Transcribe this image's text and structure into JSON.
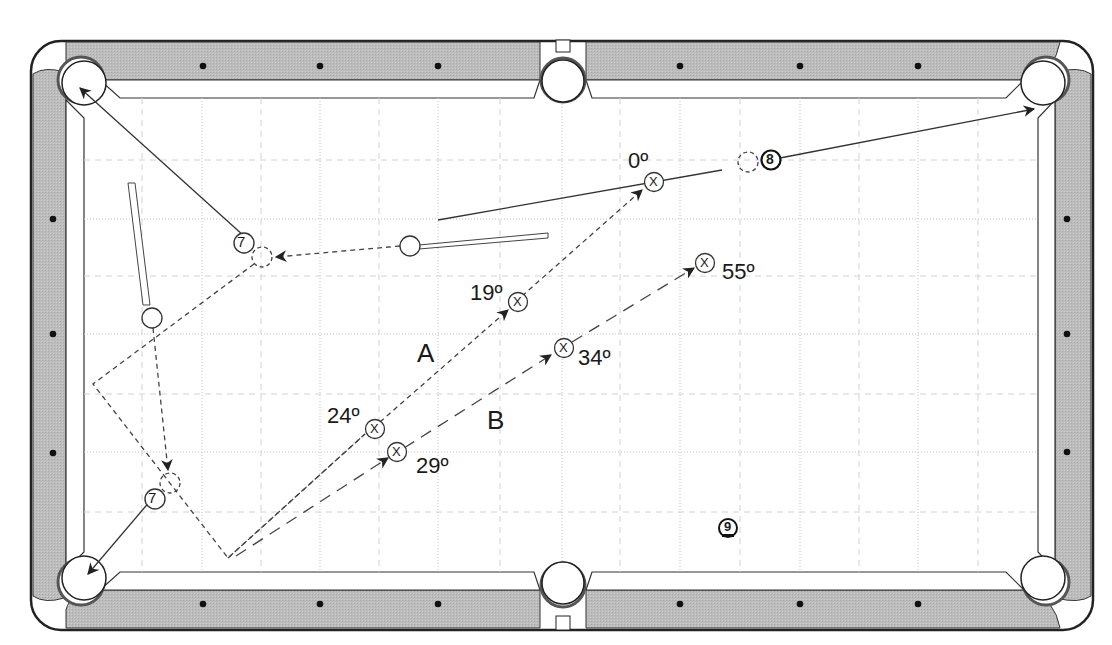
{
  "diagram": {
    "type": "pool-table-shot-diagram",
    "colors": {
      "rail": "#b9b9b9",
      "outline": "#222222",
      "grid": "#bdbdbd",
      "felt": "#ffffff",
      "line": "#333333"
    },
    "balls": {
      "seven_top": "7",
      "seven_bottom": "7",
      "eight": "8",
      "nine": "9"
    },
    "paths": {
      "a_label": "A",
      "b_label": "B"
    },
    "markers": [
      {
        "id": "x-0",
        "symbol": "X",
        "angle": "0º"
      },
      {
        "id": "x-19",
        "symbol": "X",
        "angle": "19º"
      },
      {
        "id": "x-24",
        "symbol": "X",
        "angle": "24º"
      },
      {
        "id": "x-29",
        "symbol": "X",
        "angle": "29º"
      },
      {
        "id": "x-34",
        "symbol": "X",
        "angle": "34º"
      },
      {
        "id": "x-55",
        "symbol": "X",
        "angle": "55º"
      }
    ]
  }
}
